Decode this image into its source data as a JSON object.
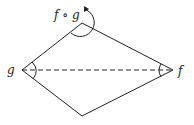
{
  "diagram": {
    "type": "rhombus-with-rotation",
    "vertices": {
      "top": {
        "x": 82,
        "y": 23
      },
      "left": {
        "x": 22,
        "y": 70
      },
      "right": {
        "x": 173,
        "y": 70
      },
      "bottom": {
        "x": 82,
        "y": 116
      }
    },
    "labels": {
      "composition": "f ∘ g",
      "left": "g",
      "right": "f"
    },
    "colors": {
      "stroke": "#222222",
      "background": "#ffffff"
    },
    "dashed_diagonal": {
      "from": "left",
      "to": "right"
    },
    "angle_marks": [
      "left",
      "right"
    ],
    "rotation_arrow": {
      "at": "top",
      "direction": "clockwise"
    }
  }
}
